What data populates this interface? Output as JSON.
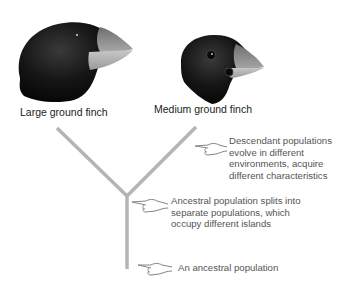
{
  "diagram": {
    "type": "evolutionary-divergence",
    "colors": {
      "branch": "#b4b4b4",
      "label_text": "#222222",
      "note_text": "#555555",
      "finch_body": "#141414",
      "beak": "#9a9a9a"
    },
    "species": [
      {
        "label": "Large ground finch",
        "beak": "large-thick"
      },
      {
        "label": "Medium ground finch",
        "beak": "medium"
      }
    ],
    "annotations": [
      {
        "icon": "pointing-hand-icon",
        "text_lines": [
          "Descendant populations",
          "evolve in different",
          "environments, acquire",
          "different characteristics"
        ]
      },
      {
        "icon": "pointing-hand-icon",
        "text_lines": [
          "Ancestral population splits into",
          "separate populations, which",
          "occupy different islands"
        ]
      },
      {
        "icon": "pointing-hand-icon",
        "text_lines": [
          "An ancestral population"
        ]
      }
    ]
  }
}
